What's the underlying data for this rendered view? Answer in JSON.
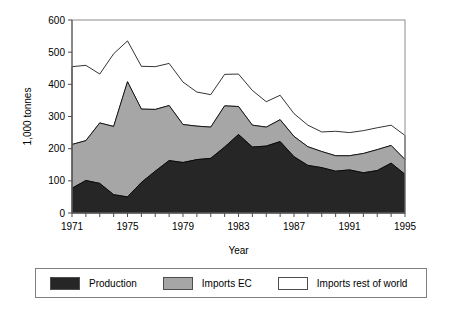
{
  "chart_data": {
    "type": "area",
    "stacked": true,
    "title": "",
    "xlabel": "Year",
    "ylabel": "1,000 tonnes",
    "xlim": [
      1971,
      1995
    ],
    "ylim": [
      0,
      600
    ],
    "ytick_labels": [
      "0",
      "100",
      "200",
      "300",
      "400",
      "500",
      "600"
    ],
    "ytick_values": [
      0,
      100,
      200,
      300,
      400,
      500,
      600
    ],
    "xtick_labels": [
      "1971",
      "1975",
      "1979",
      "1983",
      "1987",
      "1991",
      "1995"
    ],
    "xtick_values": [
      1971,
      1975,
      1979,
      1983,
      1987,
      1991,
      1995
    ],
    "minor_xticks_every": 1,
    "grid": false,
    "legend_position": "below",
    "x": [
      1971,
      1972,
      1973,
      1974,
      1975,
      1976,
      1977,
      1978,
      1979,
      1980,
      1981,
      1982,
      1983,
      1984,
      1985,
      1986,
      1987,
      1988,
      1989,
      1990,
      1991,
      1992,
      1993,
      1994,
      1995
    ],
    "series": [
      {
        "name": "Production",
        "color": "#262626",
        "values": [
          77,
          101,
          92,
          57,
          50,
          95,
          130,
          163,
          157,
          166,
          170,
          205,
          244,
          205,
          208,
          222,
          175,
          148,
          141,
          130,
          134,
          125,
          132,
          155,
          120
        ]
      },
      {
        "name": "Imports EC",
        "color": "#a6a6a6",
        "values": [
          136,
          124,
          188,
          212,
          358,
          228,
          192,
          171,
          118,
          104,
          97,
          128,
          87,
          68,
          59,
          68,
          63,
          58,
          50,
          48,
          44,
          60,
          65,
          55,
          46
        ]
      },
      {
        "name": "Imports rest of world",
        "color": "#ffffff",
        "values": [
          242,
          234,
          152,
          226,
          127,
          133,
          133,
          131,
          132,
          106,
          101,
          98,
          101,
          108,
          79,
          76,
          71,
          67,
          61,
          76,
          72,
          71,
          68,
          63,
          75
        ]
      }
    ],
    "cumulative_totals": [
      455,
      459,
      432,
      495,
      535,
      456,
      455,
      465,
      407,
      376,
      368,
      431,
      432,
      381,
      346,
      366,
      309,
      273,
      252,
      254,
      250,
      256,
      265,
      273,
      241
    ]
  },
  "axis": {
    "y_title": "1,000 tonnes",
    "x_title": "Year"
  },
  "legend": {
    "items": [
      {
        "label": "Production",
        "swatch": "#262626"
      },
      {
        "label": "Imports EC",
        "swatch": "#a6a6a6"
      },
      {
        "label": "Imports rest of world",
        "swatch": "#ffffff"
      }
    ]
  }
}
